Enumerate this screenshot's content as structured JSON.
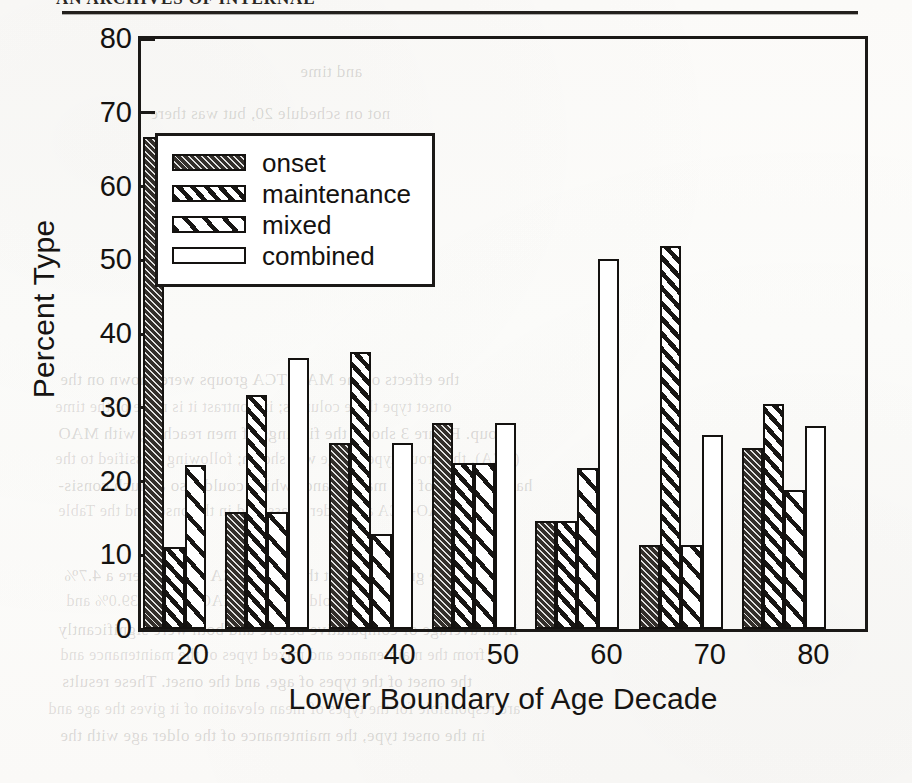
{
  "page": {
    "running_head": "AN ARCHIVES OF INTERNAL",
    "bleed_lines": [
      {
        "text": "and time",
        "x": 300,
        "y": 62,
        "cls": "f"
      },
      {
        "text": "not on schedule 20, but was there",
        "x": 150,
        "y": 104,
        "cls": "f"
      },
      {
        "text": "the maintenance of the type",
        "x": 205,
        "y": 132,
        "cls": "g"
      },
      {
        "text": "the onset type group were with",
        "x": 175,
        "y": 170,
        "cls": "f"
      },
      {
        "text": "the effects of the MAO-TCA groups were shown on the",
        "x": 60,
        "y": 370,
        "cls": "f"
      },
      {
        "text": "onset type three columns; in contrast it is more of the time",
        "x": 55,
        "y": 398,
        "cls": "g"
      },
      {
        "text": "group. Figure 3 shows the findings of men reaching with MAO",
        "x": 58,
        "y": 424,
        "cls": "f"
      },
      {
        "text": "(TCA), the group-type of age was shown; following classified to the",
        "x": 55,
        "y": 450,
        "cls": "g"
      },
      {
        "text": "had the onset of the maintenance which could also a much consis-",
        "x": 58,
        "y": 476,
        "cls": "f"
      },
      {
        "text": "tent of MAO-TCA and older; classified in the onset and the Table",
        "x": 58,
        "y": 502,
        "cls": "g"
      },
      {
        "text": "time in the group without the MAO-TCA groups were a 4.7%",
        "x": 64,
        "y": 566,
        "cls": "f"
      },
      {
        "text": "from the older and the MAO-TCA of 39.0% and",
        "x": 66,
        "y": 592,
        "cls": "g"
      },
      {
        "text": "in an average of comparative before and both were significantly",
        "x": 58,
        "y": 620,
        "cls": "f"
      },
      {
        "text": "from the maintenance and mixed types of the maintenance and",
        "x": 60,
        "y": 646,
        "cls": "g"
      },
      {
        "text": "the onset of the types of age, and the onset. These results",
        "x": 62,
        "y": 672,
        "cls": "f"
      },
      {
        "text": "are responsible for the types of mean elevation of it gives the age and",
        "x": 48,
        "y": 700,
        "cls": "g"
      },
      {
        "text": "in the onset type, the maintenance of the older age with the",
        "x": 60,
        "y": 726,
        "cls": "f"
      }
    ]
  },
  "chart_data": {
    "type": "bar",
    "title": "",
    "xlabel": "Lower Boundary of Age Decade",
    "ylabel": "Percent Type",
    "categories": [
      "20",
      "30",
      "40",
      "50",
      "60",
      "70",
      "80"
    ],
    "ylim": [
      0,
      80
    ],
    "yticks": [
      0,
      10,
      20,
      30,
      40,
      50,
      60,
      70,
      80
    ],
    "grid": false,
    "legend_position": "upper-center-left",
    "series": [
      {
        "name": "onset",
        "values": [
          66.7,
          15.9,
          25.2,
          28.0,
          14.7,
          11.4,
          24.6
        ]
      },
      {
        "name": "maintenance",
        "values": [
          11.1,
          31.7,
          37.5,
          22.5,
          14.7,
          52.0,
          30.5
        ]
      },
      {
        "name": "mixed",
        "values": [
          22.2,
          15.9,
          12.9,
          22.5,
          21.8,
          11.4,
          18.8
        ]
      },
      {
        "name": "combined",
        "values": [
          null,
          36.7,
          25.2,
          28.0,
          50.2,
          26.3,
          27.5
        ]
      }
    ]
  },
  "legend": {
    "items": [
      {
        "label": "onset",
        "pattern": "dark-fine-hatch"
      },
      {
        "label": "maintenance",
        "pattern": "dense-diagonal-stripe"
      },
      {
        "label": "mixed",
        "pattern": "wide-diagonal-stripe"
      },
      {
        "label": "combined",
        "pattern": "solid-white"
      }
    ]
  },
  "colors": {
    "ink": "#141210",
    "frame": "#1b1917",
    "onset_fill": "#332f2b",
    "paper": "#fdfdfb"
  }
}
